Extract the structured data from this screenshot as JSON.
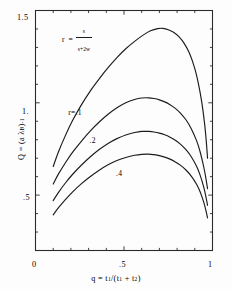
{
  "figure": {
    "background_color": "#fdfdfd",
    "ink_color": "#1c1c1c"
  },
  "chart_data": {
    "type": "line",
    "title": "",
    "subtitle": "",
    "xlabel_text": "q = t1/(t1 + t2)",
    "ylabel_text": "Q = (a λB)-1",
    "xlim": [
      0,
      1
    ],
    "ylim": [
      0.2,
      1.5
    ],
    "grid": false,
    "legend_position": "inline-curve-labels",
    "annotation": {
      "text": "r = s/(s+2w)",
      "numerator": "s",
      "denominator": "s+2w",
      "lhs": "r",
      "equals": "=",
      "x_data": 0.26,
      "y_data": 1.37
    },
    "x_ticks_major": [
      {
        "value": 0,
        "label": "0"
      },
      {
        "value": 0.5,
        "label": ".5"
      },
      {
        "value": 1,
        "label": "1"
      }
    ],
    "x_ticks_minor": [
      0.1,
      0.2,
      0.3,
      0.4,
      0.6,
      0.7,
      0.8,
      0.9
    ],
    "y_ticks_major": [
      {
        "value": 0.5,
        "label": ".5"
      },
      {
        "value": 1.0,
        "label": "1."
      },
      {
        "value": 1.5,
        "label": "1.5"
      }
    ],
    "y_ticks_minor": [
      0.3,
      0.4,
      0.6,
      0.7,
      0.8,
      0.9,
      1.1,
      1.2,
      1.3,
      1.4
    ],
    "series": [
      {
        "name": "r=.1",
        "label": "r=.1",
        "label_x_data": 0.185,
        "label_y_data": 0.945,
        "x": [
          0.1,
          0.13,
          0.17,
          0.21,
          0.26,
          0.31,
          0.36,
          0.41,
          0.46,
          0.51,
          0.56,
          0.61,
          0.65,
          0.69,
          0.72,
          0.75,
          0.78,
          0.81,
          0.84,
          0.87,
          0.9,
          0.92,
          0.94,
          0.955,
          0.965,
          0.972
        ],
        "y": [
          0.655,
          0.735,
          0.825,
          0.905,
          0.99,
          1.065,
          1.13,
          1.19,
          1.245,
          1.293,
          1.333,
          1.368,
          1.39,
          1.402,
          1.403,
          1.396,
          1.382,
          1.358,
          1.322,
          1.268,
          1.185,
          1.105,
          1.0,
          0.89,
          0.79,
          0.7
        ]
      },
      {
        "name": "r=.2",
        "label": ".2",
        "label_x_data": 0.305,
        "label_y_data": 0.795,
        "x": [
          0.1,
          0.13,
          0.17,
          0.21,
          0.26,
          0.31,
          0.36,
          0.41,
          0.46,
          0.51,
          0.56,
          0.6,
          0.64,
          0.67,
          0.7,
          0.73,
          0.76,
          0.79,
          0.82,
          0.85,
          0.88,
          0.91,
          0.93,
          0.95,
          0.962,
          0.972
        ],
        "y": [
          0.56,
          0.615,
          0.677,
          0.733,
          0.793,
          0.848,
          0.896,
          0.938,
          0.973,
          1.0,
          1.018,
          1.026,
          1.027,
          1.023,
          1.016,
          1.005,
          0.99,
          0.97,
          0.943,
          0.908,
          0.86,
          0.795,
          0.735,
          0.655,
          0.595,
          0.535
        ]
      },
      {
        "name": "r=.3",
        "label": "",
        "label_x_data": null,
        "label_y_data": null,
        "x": [
          0.1,
          0.13,
          0.17,
          0.21,
          0.26,
          0.31,
          0.36,
          0.41,
          0.46,
          0.51,
          0.56,
          0.6,
          0.64,
          0.67,
          0.7,
          0.73,
          0.76,
          0.79,
          0.82,
          0.85,
          0.88,
          0.91,
          0.93,
          0.95,
          0.962,
          0.972
        ],
        "y": [
          0.47,
          0.515,
          0.567,
          0.613,
          0.663,
          0.708,
          0.747,
          0.78,
          0.806,
          0.826,
          0.839,
          0.845,
          0.845,
          0.842,
          0.836,
          0.827,
          0.814,
          0.797,
          0.775,
          0.746,
          0.708,
          0.656,
          0.608,
          0.545,
          0.495,
          0.445
        ]
      },
      {
        "name": "r=.4",
        "label": ".4",
        "label_x_data": 0.455,
        "label_y_data": 0.612,
        "x": [
          0.1,
          0.13,
          0.17,
          0.21,
          0.26,
          0.31,
          0.36,
          0.41,
          0.46,
          0.51,
          0.56,
          0.6,
          0.64,
          0.67,
          0.7,
          0.73,
          0.76,
          0.79,
          0.82,
          0.85,
          0.88,
          0.91,
          0.93,
          0.95,
          0.962,
          0.972
        ],
        "y": [
          0.393,
          0.432,
          0.477,
          0.518,
          0.562,
          0.601,
          0.635,
          0.664,
          0.687,
          0.704,
          0.716,
          0.721,
          0.722,
          0.719,
          0.714,
          0.706,
          0.695,
          0.68,
          0.661,
          0.636,
          0.603,
          0.559,
          0.518,
          0.463,
          0.42,
          0.377
        ]
      }
    ]
  }
}
